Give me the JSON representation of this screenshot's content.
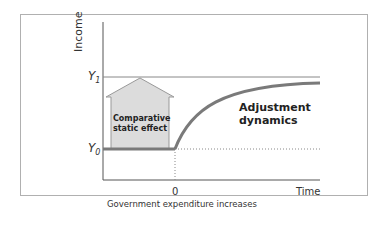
{
  "diagram": {
    "y_axis_label": "Income",
    "x_axis_label": "Time",
    "x_tick_zero": "0",
    "x_tick_caption": "Government expenditure increases",
    "y_level_high": "Y",
    "y_level_high_sub": "1",
    "y_level_low": "Y",
    "y_level_low_sub": "0",
    "arrow_label_line1": "Comparative",
    "arrow_label_line2": "static effect",
    "curve_label_line1": "Adjustment",
    "curve_label_line2": "dynamics",
    "colors": {
      "arrow_fill": "#dcdcdc",
      "line": "#7a7a7a",
      "axis": "#555555",
      "frame": "#b0b0b0"
    }
  }
}
